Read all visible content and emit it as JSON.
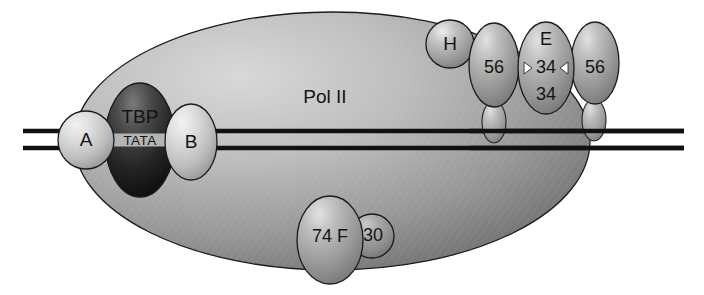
{
  "figure": {
    "background_color": "#ffffff",
    "outline_color": "#1b1b1b",
    "dna_color": "#111111"
  },
  "dna": {
    "strand_label": "DNA duplex",
    "promoter_box_label": "TATA",
    "left_end_x": 23,
    "right_end_x": 684,
    "upper_strand_y": 131,
    "lower_strand_y": 148
  },
  "core": {
    "label": "Pol II",
    "fill_light": "#c9c9c9",
    "fill_dark": "#7e7e7e"
  },
  "factors": [
    {
      "id": "tfiia",
      "label": "A",
      "shape": "circle",
      "fill": "#d6d6d6",
      "cx": 86,
      "cy": 140,
      "rx": 28,
      "ry": 29
    },
    {
      "id": "tbp",
      "label": "TBP",
      "shape": "ellipse",
      "fill": "#2a2a2a",
      "cx": 140,
      "cy": 140,
      "rx": 35,
      "ry": 57
    },
    {
      "id": "tfiib",
      "label": "B",
      "shape": "ellipse",
      "fill": "#d6d6d6",
      "cx": 191,
      "cy": 142,
      "rx": 26,
      "ry": 38
    },
    {
      "id": "tfiih",
      "label": "H",
      "shape": "circle",
      "fill": "#bdbdbd",
      "cx": 450,
      "cy": 44,
      "rx": 24,
      "ry": 24
    },
    {
      "id": "tfiif-56-left",
      "label": "56",
      "shape": "ellipse",
      "fill": "#a8a8a8",
      "cx": 494,
      "cy": 65,
      "rx": 25,
      "ry": 41
    },
    {
      "id": "tfiie",
      "label": "E",
      "shape": "ellipse",
      "fill": "#a8a8a8",
      "cx": 546,
      "cy": 68,
      "rx": 28,
      "ry": 45
    },
    {
      "id": "tfiie-34-top",
      "label": "34",
      "shape": "text",
      "cx": 546,
      "cy": 41
    },
    {
      "id": "tfiie-34-bottom",
      "label": "34",
      "shape": "text",
      "cx": 546,
      "cy": 94
    },
    {
      "id": "tfiif-56-right",
      "label": "56",
      "shape": "ellipse",
      "fill": "#a8a8a8",
      "cx": 595,
      "cy": 63,
      "rx": 24,
      "ry": 40
    },
    {
      "id": "tfiif-74",
      "label": "74 F",
      "shape": "ellipse",
      "fill": "#a0a0a0",
      "cx": 330,
      "cy": 240,
      "rx": 33,
      "ry": 43
    },
    {
      "id": "tfiif-30",
      "label": "30",
      "shape": "circle",
      "fill": "#969696",
      "cx": 372,
      "cy": 236,
      "rx": 22,
      "ry": 22
    }
  ],
  "stalks": [
    {
      "id": "stalk-left",
      "cx": 494,
      "cy": 122,
      "rx": 12,
      "ry": 20,
      "fill": "#a8a8a8"
    },
    {
      "id": "stalk-right",
      "cx": 594,
      "cy": 120,
      "rx": 12,
      "ry": 20,
      "fill": "#a8a8a8"
    }
  ],
  "notches": [
    {
      "id": "notch-left",
      "label": "left-arrow-notch"
    },
    {
      "id": "notch-right",
      "label": "right-arrow-notch"
    }
  ]
}
